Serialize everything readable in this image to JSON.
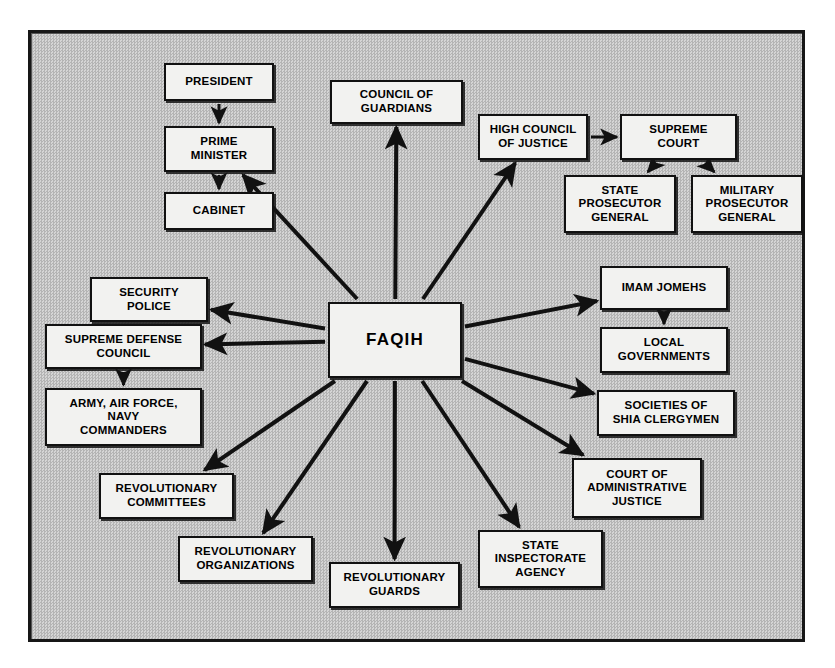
{
  "diagram": {
    "type": "organizational-hierarchy",
    "background_color": "#c3c3c3",
    "box_fill_color": "#f2f2f0",
    "line_color": "#111111",
    "frame": {
      "x": 28,
      "y": 30,
      "width": 777,
      "height": 612
    },
    "center_node": {
      "id": "faqih",
      "label": "FAQIH",
      "x": 328,
      "y": 302,
      "w": 134,
      "h": 76
    },
    "nodes": [
      {
        "id": "president",
        "label": "PRESIDENT",
        "x": 164,
        "y": 63,
        "w": 110,
        "h": 38
      },
      {
        "id": "prime-minister",
        "label": "PRIME\nMINISTER",
        "x": 164,
        "y": 126,
        "w": 110,
        "h": 46
      },
      {
        "id": "cabinet",
        "label": "CABINET",
        "x": 164,
        "y": 192,
        "w": 110,
        "h": 38
      },
      {
        "id": "council-guardians",
        "label": "COUNCIL OF\nGUARDIANS",
        "x": 330,
        "y": 80,
        "w": 133,
        "h": 44
      },
      {
        "id": "high-council",
        "label": "HIGH COUNCIL\nOF JUSTICE",
        "x": 478,
        "y": 114,
        "w": 110,
        "h": 46
      },
      {
        "id": "supreme-court",
        "label": "SUPREME\nCOURT",
        "x": 620,
        "y": 114,
        "w": 117,
        "h": 46
      },
      {
        "id": "state-prosecutor",
        "label": "STATE\nPROSECUTOR\nGENERAL",
        "x": 564,
        "y": 175,
        "w": 112,
        "h": 58
      },
      {
        "id": "military-prosecutor",
        "label": "MILITARY\nPROSECUTOR\nGENERAL",
        "x": 691,
        "y": 175,
        "w": 112,
        "h": 58
      },
      {
        "id": "security-police",
        "label": "SECURITY\nPOLICE",
        "x": 90,
        "y": 277,
        "w": 118,
        "h": 45
      },
      {
        "id": "supreme-defense",
        "label": "SUPREME DEFENSE\nCOUNCIL",
        "x": 45,
        "y": 324,
        "w": 157,
        "h": 45
      },
      {
        "id": "army-commanders",
        "label": "ARMY, AIR FORCE,\nNAVY\nCOMMANDERS",
        "x": 45,
        "y": 388,
        "w": 157,
        "h": 58
      },
      {
        "id": "imam-jomehs",
        "label": "IMAM JOMEHS",
        "x": 600,
        "y": 266,
        "w": 128,
        "h": 44
      },
      {
        "id": "local-governments",
        "label": "LOCAL\nGOVERNMENTS",
        "x": 600,
        "y": 327,
        "w": 128,
        "h": 46
      },
      {
        "id": "societies-shia",
        "label": "SOCIETIES OF\nSHIA CLERGYMEN",
        "x": 597,
        "y": 390,
        "w": 138,
        "h": 46
      },
      {
        "id": "court-admin",
        "label": "COURT OF\nADMINISTRATIVE\nJUSTICE",
        "x": 572,
        "y": 458,
        "w": 130,
        "h": 60
      },
      {
        "id": "rev-committees",
        "label": "REVOLUTIONARY\nCOMMITTEES",
        "x": 99,
        "y": 473,
        "w": 135,
        "h": 46
      },
      {
        "id": "rev-organizations",
        "label": "REVOLUTIONARY\nORGANIZATIONS",
        "x": 178,
        "y": 536,
        "w": 135,
        "h": 46
      },
      {
        "id": "rev-guards",
        "label": "REVOLUTIONARY\nGUARDS",
        "x": 329,
        "y": 562,
        "w": 131,
        "h": 46
      },
      {
        "id": "state-inspectorate",
        "label": "STATE\nINSPECTORATE\nAGENCY",
        "x": 478,
        "y": 530,
        "w": 125,
        "h": 58
      }
    ],
    "edges": [
      {
        "from": "president",
        "to": "prime-minister",
        "kind": "hierarchy"
      },
      {
        "from": "prime-minister",
        "to": "cabinet",
        "kind": "hierarchy"
      },
      {
        "from": "high-council",
        "to": "supreme-court",
        "kind": "hierarchy"
      },
      {
        "from": "supreme-court",
        "to": "state-prosecutor",
        "kind": "hierarchy"
      },
      {
        "from": "supreme-court",
        "to": "military-prosecutor",
        "kind": "hierarchy"
      },
      {
        "from": "supreme-defense",
        "to": "army-commanders",
        "kind": "hierarchy"
      },
      {
        "from": "imam-jomehs",
        "to": "local-governments",
        "kind": "hierarchy"
      },
      {
        "from": "faqih",
        "to": "prime-minister",
        "kind": "radial"
      },
      {
        "from": "faqih",
        "to": "council-guardians",
        "kind": "radial"
      },
      {
        "from": "faqih",
        "to": "high-council",
        "kind": "radial"
      },
      {
        "from": "faqih",
        "to": "security-police",
        "kind": "radial"
      },
      {
        "from": "faqih",
        "to": "supreme-defense",
        "kind": "radial"
      },
      {
        "from": "faqih",
        "to": "imam-jomehs",
        "kind": "radial"
      },
      {
        "from": "faqih",
        "to": "societies-shia",
        "kind": "radial"
      },
      {
        "from": "faqih",
        "to": "court-admin",
        "kind": "radial"
      },
      {
        "from": "faqih",
        "to": "state-inspectorate",
        "kind": "radial"
      },
      {
        "from": "faqih",
        "to": "rev-guards",
        "kind": "radial"
      },
      {
        "from": "faqih",
        "to": "rev-organizations",
        "kind": "radial"
      },
      {
        "from": "faqih",
        "to": "rev-committees",
        "kind": "radial"
      }
    ]
  }
}
